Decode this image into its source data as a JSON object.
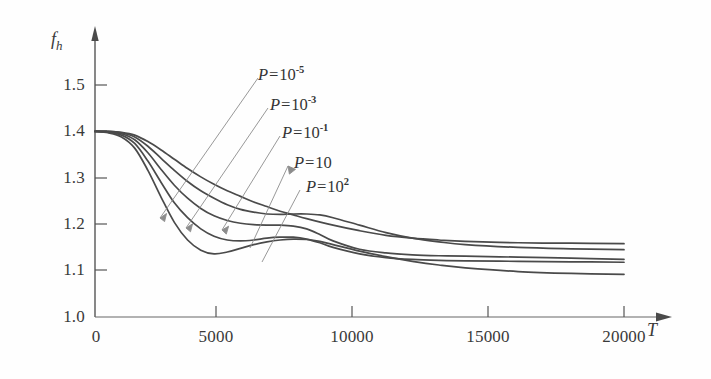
{
  "figure": {
    "background_color": "#fefefe",
    "ink_color": "#4a4a4a",
    "axis_color": "#555555"
  },
  "axes": {
    "y_label": "f",
    "y_label_sub": "h",
    "x_label": "T",
    "y_ticks": [
      "1.0",
      "1.1",
      "1.2",
      "1.3",
      "1.4",
      "1.5"
    ],
    "x_ticks": [
      "0",
      "5000",
      "10000",
      "15000",
      "20000"
    ],
    "x_origin_label": "0"
  },
  "annotations": [
    {
      "prefix": "P=",
      "base": "10",
      "exponent": "-5",
      "series": "P=10^-5"
    },
    {
      "prefix": "P=",
      "base": "10",
      "exponent": "-3",
      "series": "P=10^-3"
    },
    {
      "prefix": "P=",
      "base": "10",
      "exponent": "-1",
      "series": "P=10^-1"
    },
    {
      "prefix": "P=",
      "base": "10",
      "exponent": "",
      "series": "P=10"
    },
    {
      "prefix": "P=",
      "base": "10",
      "exponent": "2",
      "series": "P=10^2"
    }
  ],
  "chart_data": {
    "type": "line",
    "title": "",
    "subtitle": "",
    "xlabel": "T",
    "ylabel": "f_h",
    "xlim": [
      0,
      20000
    ],
    "ylim": [
      1.0,
      1.5
    ],
    "xticks": [
      0,
      5000,
      10000,
      15000,
      20000
    ],
    "yticks": [
      1.0,
      1.1,
      1.2,
      1.3,
      1.4,
      1.5
    ],
    "grid": false,
    "legend": "inline-annotations",
    "legend_position": "upper-right-with-leader-lines",
    "series": [
      {
        "name": "P=10^-5",
        "x": [
          0,
          500,
          1000,
          1500,
          2000,
          2500,
          3000,
          3500,
          4000,
          4500,
          5000,
          5500,
          6000,
          6500,
          7000,
          7500,
          8000,
          9000,
          10000,
          11000,
          12000,
          13000,
          14000,
          16000,
          18000,
          20000
        ],
        "y": [
          1.4,
          1.4,
          1.398,
          1.392,
          1.378,
          1.36,
          1.34,
          1.32,
          1.302,
          1.286,
          1.272,
          1.26,
          1.248,
          1.238,
          1.228,
          1.22,
          1.212,
          1.198,
          1.186,
          1.176,
          1.17,
          1.166,
          1.163,
          1.16,
          1.159,
          1.158
        ]
      },
      {
        "name": "P=10^-3",
        "x": [
          0,
          500,
          1000,
          1500,
          2000,
          2500,
          3000,
          3500,
          4000,
          4500,
          5000,
          5500,
          6000,
          6500,
          7000,
          7500,
          8000,
          8500,
          9000,
          10000,
          11000,
          12000,
          13000,
          14000,
          16000,
          18000,
          20000
        ],
        "y": [
          1.4,
          1.4,
          1.397,
          1.388,
          1.368,
          1.342,
          1.316,
          1.292,
          1.272,
          1.256,
          1.242,
          1.232,
          1.226,
          1.222,
          1.221,
          1.222,
          1.222,
          1.22,
          1.214,
          1.198,
          1.182,
          1.17,
          1.162,
          1.156,
          1.15,
          1.147,
          1.145
        ]
      },
      {
        "name": "P=10^-1",
        "x": [
          0,
          500,
          1000,
          1500,
          2000,
          2500,
          3000,
          3500,
          4000,
          4500,
          5000,
          5500,
          6000,
          6500,
          7000,
          7500,
          8000,
          8500,
          9000,
          10000,
          11000,
          12000,
          13000,
          14000,
          16000,
          18000,
          20000
        ],
        "y": [
          1.4,
          1.399,
          1.395,
          1.382,
          1.354,
          1.318,
          1.284,
          1.256,
          1.234,
          1.218,
          1.208,
          1.202,
          1.199,
          1.198,
          1.198,
          1.196,
          1.19,
          1.178,
          1.164,
          1.146,
          1.138,
          1.134,
          1.132,
          1.131,
          1.129,
          1.127,
          1.124
        ]
      },
      {
        "name": "P=10",
        "x": [
          0,
          500,
          1000,
          1500,
          2000,
          2500,
          3000,
          3500,
          4000,
          4500,
          5000,
          5500,
          6000,
          6500,
          7000,
          7500,
          8000,
          8500,
          9000,
          10000,
          11000,
          12000,
          13000,
          14000,
          16000,
          18000,
          20000
        ],
        "y": [
          1.4,
          1.398,
          1.392,
          1.374,
          1.336,
          1.29,
          1.246,
          1.214,
          1.19,
          1.174,
          1.166,
          1.164,
          1.166,
          1.17,
          1.172,
          1.172,
          1.168,
          1.16,
          1.15,
          1.136,
          1.128,
          1.124,
          1.122,
          1.121,
          1.12,
          1.119,
          1.118
        ]
      },
      {
        "name": "P=10^2",
        "x": [
          0,
          500,
          1000,
          1500,
          2000,
          2500,
          3000,
          3500,
          4000,
          4500,
          5000,
          5500,
          6000,
          6500,
          7000,
          7500,
          8000,
          8500,
          9000,
          10000,
          11000,
          12000,
          13000,
          14000,
          16000,
          18000,
          20000
        ],
        "y": [
          1.4,
          1.397,
          1.388,
          1.364,
          1.316,
          1.258,
          1.204,
          1.166,
          1.144,
          1.136,
          1.14,
          1.148,
          1.156,
          1.162,
          1.166,
          1.168,
          1.167,
          1.163,
          1.156,
          1.142,
          1.13,
          1.12,
          1.112,
          1.106,
          1.098,
          1.094,
          1.092
        ]
      }
    ]
  }
}
